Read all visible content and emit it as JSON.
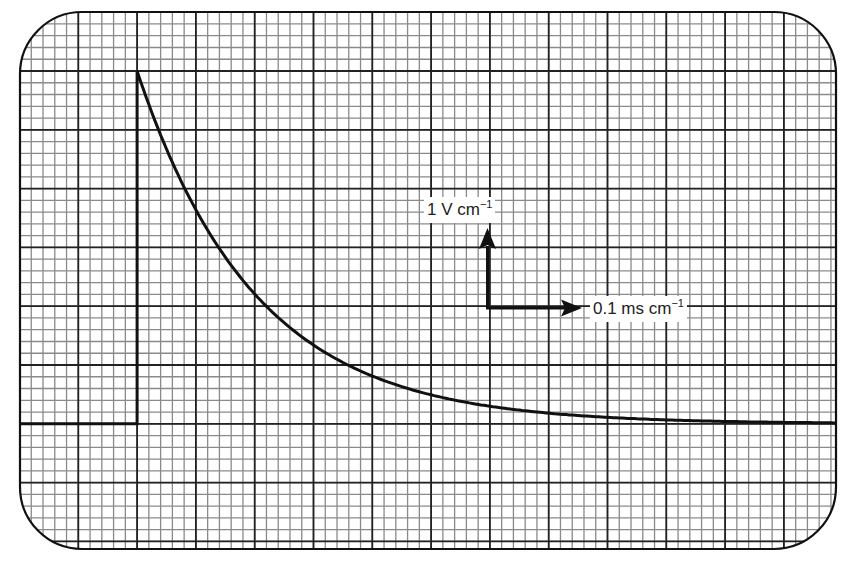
{
  "chart_data": {
    "type": "line",
    "title": "",
    "xlabel": "",
    "ylabel": "",
    "scale": {
      "vertical": {
        "value": "1",
        "unit": "V",
        "per": "cm",
        "exponent": "-1",
        "text": "1 V cm⁻¹"
      },
      "horizontal": {
        "value": "0.1",
        "unit": "ms",
        "per": "cm",
        "exponent": "-1",
        "text": "0.1 ms cm⁻¹"
      }
    },
    "grid": {
      "on": true,
      "major_divisions_x": 14,
      "major_divisions_y": 9,
      "minor_per_major": 5,
      "major_px": 58.8
    },
    "xlim_div": [
      -2,
      12
    ],
    "ylim_div": [
      -2,
      7
    ],
    "baseline_div": 0,
    "series": [
      {
        "name": "trace",
        "x_div": [
          -2,
          0,
          0,
          0.25,
          0.5,
          0.75,
          1,
          1.5,
          2,
          2.5,
          3,
          4,
          5,
          6,
          7,
          8,
          10,
          12
        ],
        "y_div": [
          0,
          0,
          6.0,
          5.3,
          4.7,
          4.1,
          3.6,
          2.8,
          2.15,
          1.65,
          1.25,
          0.8,
          0.5,
          0.25,
          0.1,
          0.03,
          0.0,
          0.0
        ]
      }
    ],
    "x_ms": [
      -0.2,
      0,
      0,
      0.025,
      0.05,
      0.075,
      0.1,
      0.15,
      0.2,
      0.25,
      0.3,
      0.4,
      0.5,
      0.6,
      0.7,
      0.8,
      1.0,
      1.2
    ],
    "y_V": [
      0,
      0,
      6.0,
      5.3,
      4.7,
      4.1,
      3.6,
      2.8,
      2.15,
      1.65,
      1.25,
      0.8,
      0.5,
      0.25,
      0.1,
      0.03,
      0.0,
      0.0
    ],
    "peak_V": 6,
    "time_constant_ms": 0.2,
    "annotations": [
      {
        "text": "1 V cm⁻¹",
        "arrow": "up"
      },
      {
        "text": "0.1 ms cm⁻¹",
        "arrow": "right"
      }
    ]
  },
  "labels": {
    "vertical": {
      "main": "1 V cm",
      "sup": "−1"
    },
    "horizontal": {
      "main": "0.1 ms cm",
      "sup": "−1"
    }
  },
  "colors": {
    "frame": "#111111",
    "major_grid": "#222222",
    "minor_grid": "#8a8a8a",
    "trace": "#111111",
    "background": "#ffffff"
  }
}
